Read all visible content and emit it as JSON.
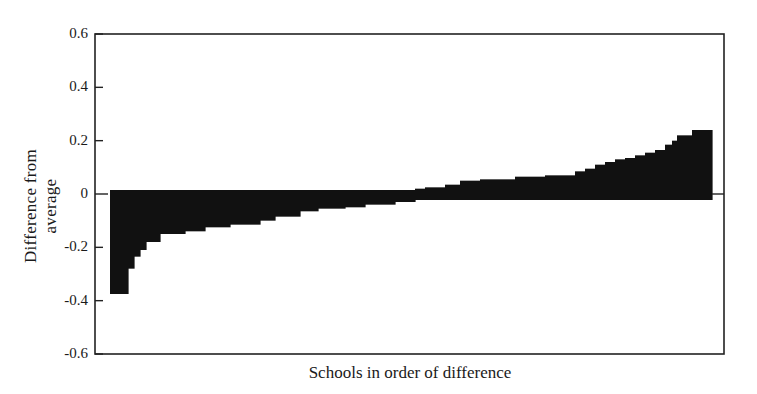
{
  "chart_data": {
    "type": "bar",
    "title": "",
    "xlabel": "Schools in order of difference",
    "ylabel": "Difference from average",
    "ylim": [
      -0.6,
      0.6
    ],
    "yticks": [
      0.6,
      0.4,
      0.2,
      0,
      -0.2,
      -0.4,
      -0.6
    ],
    "ytick_labels": [
      "0.6",
      "0.4",
      "0.2",
      "0",
      "-0.2",
      "-0.4",
      "-0.6"
    ],
    "grid": false,
    "legend": null,
    "bar_color": "#111111",
    "bars": [
      {
        "x0": 110,
        "x1": 128,
        "value": -0.375
      },
      {
        "x0": 128,
        "x1": 134,
        "value": -0.28
      },
      {
        "x0": 134,
        "x1": 140,
        "value": -0.235
      },
      {
        "x0": 140,
        "x1": 146,
        "value": -0.21
      },
      {
        "x0": 146,
        "x1": 160,
        "value": -0.18
      },
      {
        "x0": 160,
        "x1": 185,
        "value": -0.15
      },
      {
        "x0": 185,
        "x1": 205,
        "value": -0.14
      },
      {
        "x0": 205,
        "x1": 230,
        "value": -0.125
      },
      {
        "x0": 230,
        "x1": 260,
        "value": -0.115
      },
      {
        "x0": 260,
        "x1": 275,
        "value": -0.1
      },
      {
        "x0": 275,
        "x1": 300,
        "value": -0.085
      },
      {
        "x0": 300,
        "x1": 318,
        "value": -0.065
      },
      {
        "x0": 318,
        "x1": 345,
        "value": -0.055
      },
      {
        "x0": 345,
        "x1": 365,
        "value": -0.05
      },
      {
        "x0": 365,
        "x1": 395,
        "value": -0.04
      },
      {
        "x0": 395,
        "x1": 415,
        "value": -0.03
      },
      {
        "x0": 415,
        "x1": 425,
        "value": 0.02
      },
      {
        "x0": 425,
        "x1": 445,
        "value": 0.025
      },
      {
        "x0": 445,
        "x1": 460,
        "value": 0.035
      },
      {
        "x0": 460,
        "x1": 480,
        "value": 0.05
      },
      {
        "x0": 480,
        "x1": 515,
        "value": 0.055
      },
      {
        "x0": 515,
        "x1": 545,
        "value": 0.065
      },
      {
        "x0": 545,
        "x1": 575,
        "value": 0.07
      },
      {
        "x0": 575,
        "x1": 585,
        "value": 0.085
      },
      {
        "x0": 585,
        "x1": 595,
        "value": 0.095
      },
      {
        "x0": 595,
        "x1": 605,
        "value": 0.11
      },
      {
        "x0": 605,
        "x1": 615,
        "value": 0.12
      },
      {
        "x0": 615,
        "x1": 625,
        "value": 0.13
      },
      {
        "x0": 625,
        "x1": 635,
        "value": 0.135
      },
      {
        "x0": 635,
        "x1": 645,
        "value": 0.145
      },
      {
        "x0": 645,
        "x1": 655,
        "value": 0.155
      },
      {
        "x0": 655,
        "x1": 665,
        "value": 0.165
      },
      {
        "x0": 665,
        "x1": 672,
        "value": 0.185
      },
      {
        "x0": 672,
        "x1": 677,
        "value": 0.2
      },
      {
        "x0": 677,
        "x1": 692,
        "value": 0.22
      },
      {
        "x0": 692,
        "x1": 712,
        "value": 0.24
      }
    ],
    "categories": [
      "schools ranked 1..N (unlabeled)"
    ],
    "values_summary": {
      "min": -0.375,
      "max": 0.24
    }
  }
}
